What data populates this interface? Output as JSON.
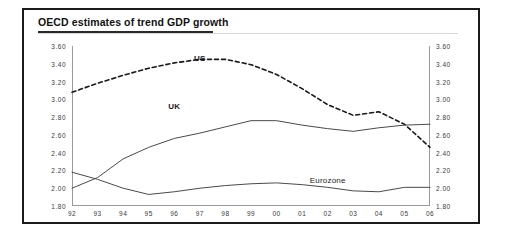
{
  "chart_data": {
    "type": "line",
    "title": "OECD estimates of trend GDP growth",
    "xlabel": "",
    "ylabel": "",
    "ylim": [
      1.8,
      3.6
    ],
    "grid": false,
    "legend_position": "inline-annotations",
    "y_ticks": [
      "3.60",
      "3.40",
      "3.20",
      "3.00",
      "2.80",
      "2.60",
      "2.40",
      "2.20",
      "2.00",
      "1.80"
    ],
    "y_tick_values": [
      3.6,
      3.4,
      3.2,
      3.0,
      2.8,
      2.6,
      2.4,
      2.2,
      2.0,
      1.8
    ],
    "right_axis_ticks": [
      "3.60",
      "3.40",
      "3.20",
      "3.00",
      "2.80",
      "2.60",
      "2.40",
      "2.20",
      "2.00",
      "1.80"
    ],
    "categories": [
      "92",
      "93",
      "94",
      "95",
      "96",
      "97",
      "98",
      "99",
      "00",
      "01",
      "02",
      "03",
      "04",
      "05",
      "06"
    ],
    "series": [
      {
        "name": "US",
        "style": "dashed",
        "color": "#1a1a1a",
        "label_x": "97",
        "label_y": 3.47,
        "values": [
          3.08,
          3.18,
          3.27,
          3.35,
          3.41,
          3.45,
          3.45,
          3.39,
          3.28,
          3.12,
          2.94,
          2.82,
          2.86,
          2.72,
          2.46
        ]
      },
      {
        "name": "UK",
        "style": "solid",
        "color": "#4a4a4a",
        "label_x": "96",
        "label_y": 2.92,
        "values": [
          2.0,
          2.12,
          2.33,
          2.46,
          2.56,
          2.62,
          2.69,
          2.76,
          2.76,
          2.71,
          2.67,
          2.64,
          2.68,
          2.71,
          2.72
        ]
      },
      {
        "name": "Eurozone",
        "style": "solid",
        "color": "#4a4a4a",
        "label_x": "02",
        "label_y": 2.09,
        "values": [
          2.18,
          2.1,
          2.0,
          1.93,
          1.96,
          2.0,
          2.03,
          2.05,
          2.06,
          2.04,
          2.01,
          1.97,
          1.96,
          2.01,
          2.01
        ]
      }
    ]
  }
}
